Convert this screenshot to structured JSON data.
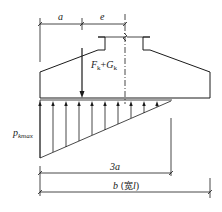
{
  "figure": {
    "type": "foundation eccentric load pressure diagram",
    "dimensions": {
      "a": "a",
      "e": "e",
      "three_a": "3a",
      "b_label": "b",
      "b_paren": "(宽",
      "b_paren_l": "l",
      "b_paren_close": ")"
    },
    "load": {
      "F": "F",
      "F_sub": "k",
      "plus": "+",
      "G": "G",
      "G_sub": "k"
    },
    "pressure": {
      "p": "p",
      "p_sub": "kmax"
    },
    "colors": {
      "line": "#1a1a1a",
      "background": "#ffffff"
    },
    "arrow_count": 10
  }
}
